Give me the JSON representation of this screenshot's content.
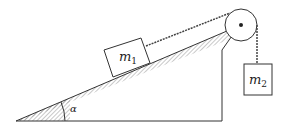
{
  "diagram": {
    "mass1": {
      "symbol": "m",
      "subscript": "1"
    },
    "mass2": {
      "symbol": "m",
      "subscript": "2"
    },
    "angle_label": "α",
    "colors": {
      "stroke": "#333333",
      "hatch": "#666666"
    }
  }
}
